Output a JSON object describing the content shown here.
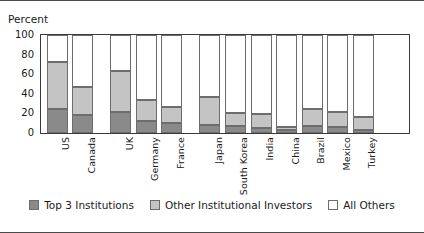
{
  "chart_data": {
    "type": "bar",
    "subtype": "stacked-bar-100",
    "title": "",
    "ylabel": "Percent",
    "xlabel": "",
    "ylim": [
      0,
      100
    ],
    "yticks": [
      0,
      20,
      40,
      60,
      80,
      100
    ],
    "grid": false,
    "legend_position": "bottom-center",
    "categories": [
      "US",
      "Canada",
      "UK",
      "Germany",
      "France",
      "Japan",
      "South Korea",
      "India",
      "China",
      "Brazil",
      "Mexico",
      "Turkey"
    ],
    "series": [
      {
        "name": "Top 3 Institutions",
        "color": "#8a8a8a",
        "values": [
          25,
          18,
          21,
          12,
          10,
          8,
          7,
          5,
          3,
          7,
          6,
          3
        ]
      },
      {
        "name": "Other Institutional Investors",
        "color": "#c4c4c4",
        "values": [
          47,
          29,
          42,
          22,
          17,
          29,
          13,
          14,
          3,
          17,
          15,
          13
        ]
      },
      {
        "name": "All Others",
        "color": "#ffffff",
        "values": [
          28,
          53,
          37,
          66,
          73,
          63,
          80,
          81,
          94,
          76,
          79,
          84
        ]
      }
    ],
    "group_breaks_after": [
      "Canada",
      "France"
    ]
  },
  "legend": {
    "items": [
      {
        "label": "Top 3 Institutions",
        "swatch": "s0"
      },
      {
        "label": "Other Institutional Investors",
        "swatch": "s1"
      },
      {
        "label": "All Others",
        "swatch": "s2"
      }
    ]
  }
}
